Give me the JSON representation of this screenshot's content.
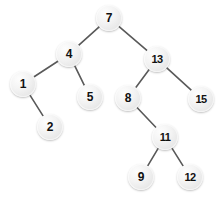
{
  "diagram": {
    "type": "binary-search-tree",
    "background_color": "#ffffff",
    "node_fill_color": "#ececec",
    "node_text_color": "#111111",
    "edge_color": "#595959",
    "node_diameter": 26,
    "canvas": {
      "width": 222,
      "height": 202
    },
    "nodes": [
      {
        "id": "n7",
        "label": "7",
        "cx": 109,
        "cy": 18,
        "level": 0
      },
      {
        "id": "n4",
        "label": "4",
        "cx": 69,
        "cy": 54,
        "level": 1
      },
      {
        "id": "n13",
        "label": "13",
        "cx": 157,
        "cy": 59,
        "level": 1
      },
      {
        "id": "n1",
        "label": "1",
        "cx": 23,
        "cy": 84,
        "level": 2
      },
      {
        "id": "n5",
        "label": "5",
        "cx": 90,
        "cy": 97,
        "level": 2
      },
      {
        "id": "n8",
        "label": "8",
        "cx": 128,
        "cy": 98,
        "level": 2
      },
      {
        "id": "n15",
        "label": "15",
        "cx": 201,
        "cy": 99,
        "level": 2
      },
      {
        "id": "n2",
        "label": "2",
        "cx": 50,
        "cy": 127,
        "level": 3
      },
      {
        "id": "n11",
        "label": "11",
        "cx": 165,
        "cy": 137,
        "level": 3
      },
      {
        "id": "n9",
        "label": "9",
        "cx": 141,
        "cy": 177,
        "level": 4
      },
      {
        "id": "n12",
        "label": "12",
        "cx": 190,
        "cy": 177,
        "level": 4
      }
    ],
    "edges": [
      {
        "from": "n7",
        "to": "n4",
        "side": "left"
      },
      {
        "from": "n7",
        "to": "n13",
        "side": "right"
      },
      {
        "from": "n4",
        "to": "n1",
        "side": "left"
      },
      {
        "from": "n4",
        "to": "n5",
        "side": "right"
      },
      {
        "from": "n1",
        "to": "n2",
        "side": "right"
      },
      {
        "from": "n13",
        "to": "n8",
        "side": "left"
      },
      {
        "from": "n13",
        "to": "n15",
        "side": "right"
      },
      {
        "from": "n8",
        "to": "n11",
        "side": "right"
      },
      {
        "from": "n11",
        "to": "n9",
        "side": "left"
      },
      {
        "from": "n11",
        "to": "n12",
        "side": "right"
      }
    ]
  }
}
